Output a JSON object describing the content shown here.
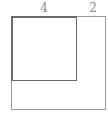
{
  "diagram": {
    "labels": {
      "inner_side": "4",
      "remaining_side": "2"
    },
    "shapes": [
      {
        "name": "outer-square",
        "side": 6
      },
      {
        "name": "inner-square",
        "side": 4,
        "position": "top-left"
      }
    ],
    "colors": {
      "outer_stroke": "#9a9a9a",
      "inner_stroke": "#6a6a6a",
      "label": "#8a8a8a",
      "background": "#ffffff"
    }
  }
}
